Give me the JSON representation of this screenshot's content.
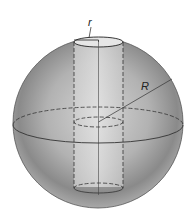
{
  "figure": {
    "labels": {
      "small_radius": "r",
      "large_radius": "R"
    },
    "colors": {
      "sphere_light": "#d8d8d8",
      "sphere_dark": "#7a7a7a",
      "cylinder_fill": "#dcdcdc",
      "line": "#333333",
      "background": "#ffffff"
    }
  }
}
